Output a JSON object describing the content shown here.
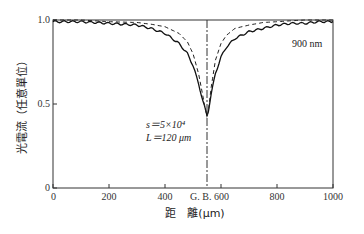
{
  "chart_data": {
    "type": "line",
    "title": "",
    "xlabel": "距　離(μm)",
    "ylabel": "光電流（任意單位）",
    "xlim": [
      0,
      1000
    ],
    "ylim": [
      0,
      1.0
    ],
    "x_ticks": [
      "0",
      "200",
      "400",
      "G. B. 600",
      "800",
      "1000"
    ],
    "x_tick_values": [
      0,
      200,
      400,
      600,
      800,
      1000
    ],
    "y_ticks": [
      "0",
      "0.5",
      "1.0"
    ],
    "y_tick_values": [
      0,
      0.5,
      1.0
    ],
    "grid": false,
    "grain_boundary_x": 550,
    "grain_boundary_label": "G. B.",
    "annotations": {
      "wavelength": "900 nm",
      "s_param": "s＝5×10⁴",
      "L_param": "L＝120 μm"
    },
    "series": [
      {
        "name": "measured (solid, 900 nm)",
        "style": "solid",
        "x": [
          0,
          100,
          200,
          300,
          350,
          400,
          450,
          480,
          500,
          520,
          535,
          545,
          550,
          555,
          565,
          580,
          600,
          620,
          650,
          700,
          750,
          800,
          850,
          900,
          950,
          1000
        ],
        "y": [
          0.99,
          0.99,
          0.98,
          0.97,
          0.95,
          0.92,
          0.86,
          0.8,
          0.73,
          0.62,
          0.52,
          0.46,
          0.43,
          0.46,
          0.56,
          0.68,
          0.78,
          0.84,
          0.89,
          0.93,
          0.95,
          0.97,
          0.98,
          0.98,
          0.99,
          0.99
        ]
      },
      {
        "name": "calculated (dashed)",
        "style": "dashed",
        "x": [
          0,
          100,
          200,
          300,
          350,
          400,
          450,
          480,
          500,
          520,
          535,
          545,
          550,
          555,
          565,
          580,
          600,
          620,
          650,
          700,
          750,
          800,
          850,
          900,
          950,
          1000
        ],
        "y": [
          1.0,
          1.0,
          0.99,
          0.985,
          0.975,
          0.96,
          0.92,
          0.87,
          0.8,
          0.68,
          0.55,
          0.46,
          0.43,
          0.46,
          0.6,
          0.76,
          0.86,
          0.91,
          0.95,
          0.97,
          0.985,
          0.99,
          0.995,
          1.0,
          1.0,
          1.0
        ]
      }
    ]
  }
}
